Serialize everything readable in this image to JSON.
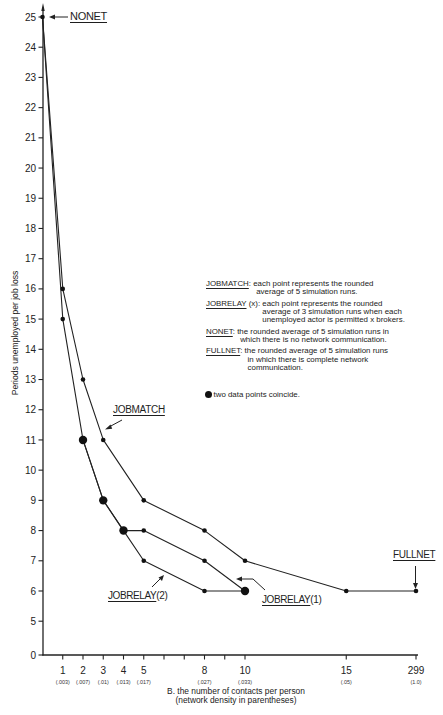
{
  "chart_data": {
    "type": "line",
    "title": "",
    "xlabel": "B. the number of contacts per person",
    "xlabel_note": "(network density in parentheses)",
    "ylabel": "Periods unemployed per job loss",
    "ylim": [
      0,
      25
    ],
    "y_axis_break": "between 0 and 5",
    "x_axis_break": "between 15 and 299",
    "grid": false,
    "legend_position": "right-middle",
    "y_ticks": [
      0,
      5,
      6,
      7,
      8,
      9,
      10,
      11,
      12,
      13,
      14,
      15,
      16,
      17,
      18,
      19,
      20,
      21,
      22,
      23,
      24,
      25
    ],
    "x_ticks": [
      {
        "value": 1,
        "label": "1",
        "density": "(.003)"
      },
      {
        "value": 2,
        "label": "2",
        "density": "(.007)"
      },
      {
        "value": 3,
        "label": "3",
        "density": "(.01)"
      },
      {
        "value": 4,
        "label": "4",
        "density": "(.013)"
      },
      {
        "value": 5,
        "label": "5",
        "density": "(.017)"
      },
      {
        "value": 6,
        "label": "",
        "density": ""
      },
      {
        "value": 7,
        "label": "",
        "density": ""
      },
      {
        "value": 8,
        "label": "8",
        "density": "(.027)"
      },
      {
        "value": 9,
        "label": "",
        "density": ""
      },
      {
        "value": 10,
        "label": "10",
        "density": "(.033)"
      },
      {
        "value": 15,
        "label": "15",
        "density": "(.05)"
      },
      {
        "value": 299,
        "label": "299",
        "density": "(1.0)"
      }
    ],
    "series": [
      {
        "name": "NONET",
        "points": [
          [
            0,
            25
          ]
        ]
      },
      {
        "name": "JOBMATCH",
        "points": [
          [
            0,
            25
          ],
          [
            1,
            16
          ],
          [
            2,
            13
          ],
          [
            3,
            11
          ],
          [
            5,
            9
          ],
          [
            8,
            8
          ],
          [
            10,
            7
          ],
          [
            15,
            6
          ],
          [
            299,
            6
          ]
        ]
      },
      {
        "name": "JOBRELAY(1)",
        "points": [
          [
            0,
            25
          ],
          [
            1,
            15
          ],
          [
            2,
            11
          ],
          [
            3,
            9
          ],
          [
            4,
            8
          ],
          [
            5,
            8
          ],
          [
            8,
            7
          ],
          [
            10,
            6
          ]
        ]
      },
      {
        "name": "JOBRELAY(2)",
        "points": [
          [
            2,
            11
          ],
          [
            3,
            9
          ],
          [
            4,
            8
          ],
          [
            5,
            7
          ],
          [
            8,
            6
          ],
          [
            10,
            6
          ]
        ]
      },
      {
        "name": "FULLNET",
        "points": [
          [
            299,
            6
          ]
        ]
      }
    ],
    "coincident_points": [
      [
        2,
        11
      ],
      [
        3,
        9
      ],
      [
        4,
        8
      ],
      [
        10,
        6
      ]
    ],
    "colors": {
      "line": "#222222",
      "marker": "#111111"
    }
  },
  "annotations": {
    "nonet": "NONET",
    "jobmatch": "JOBMATCH",
    "jobrelay2_name": "JOBRELAY",
    "jobrelay2_arg": "(2)",
    "jobrelay1_name": "JOBRELAY",
    "jobrelay1_arg": "(1)",
    "fullnet": "FULLNET"
  },
  "legend": {
    "entries": [
      {
        "key": "JOBMATCH",
        "suffix": ":",
        "lines": [
          "each point represents the rounded",
          "average of 5 simulation runs."
        ]
      },
      {
        "key": "JOBRELAY",
        "suffix": " (x):",
        "lines": [
          "each point represents the rounded",
          "average of 3 simulation runs when each",
          "unemployed actor is permitted x brokers."
        ]
      },
      {
        "key": "NONET",
        "suffix": ":",
        "lines": [
          "the rounded average of 5 simulation runs in",
          "which there is no network communication."
        ]
      },
      {
        "key": "FULLNET",
        "suffix": ":",
        "lines": [
          "the rounded average of 5 simulation runs",
          "in which there is complete network",
          "communication."
        ]
      }
    ],
    "coincide_note": "two data points coincide."
  }
}
